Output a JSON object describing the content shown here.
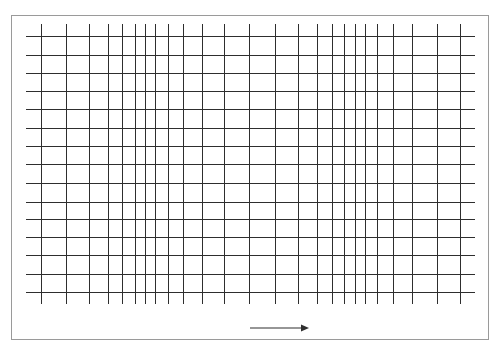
{
  "figure": {
    "colors": {
      "background": "#ffffff",
      "border": "#9a9a9a",
      "grid_line": "#2e2e2e",
      "arrow": "#2e2e2e"
    },
    "border": {
      "x": 11,
      "y": 15,
      "width": 477,
      "height": 324
    },
    "vertical_lines": {
      "x": [
        41,
        66,
        89,
        108,
        122,
        135,
        145,
        155,
        168,
        183,
        202,
        224,
        249,
        275,
        298,
        317,
        332,
        344,
        355,
        365,
        377,
        393,
        412,
        437,
        460
      ],
      "y_start": 24,
      "y_end": 304
    },
    "horizontal_lines": {
      "y": [
        36,
        55,
        73,
        91,
        109,
        128,
        146,
        164,
        183,
        202,
        219,
        237,
        255,
        274,
        292
      ],
      "x_start": 26,
      "x_end": 475
    },
    "arrow": {
      "x1": 250,
      "x2": 309,
      "y": 328,
      "direction": "right",
      "icon": "arrow-right-icon"
    }
  }
}
